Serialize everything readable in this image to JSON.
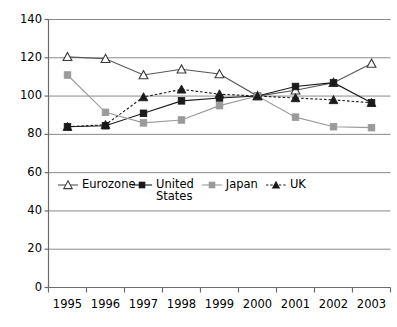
{
  "chart_data": {
    "type": "line",
    "title": "",
    "xlabel": "",
    "ylabel": "",
    "categories": [
      "1995",
      "1996",
      "1997",
      "1998",
      "1999",
      "2000",
      "2001",
      "2002",
      "2003"
    ],
    "x": [
      1995,
      1996,
      1997,
      1998,
      1999,
      2000,
      2001,
      2002,
      2003
    ],
    "ylim": [
      0,
      140
    ],
    "yticks": [
      0,
      20,
      40,
      60,
      80,
      100,
      120,
      140
    ],
    "ytick_labels": [
      "0",
      "20",
      "40",
      "60",
      "80",
      "100",
      "120",
      "140"
    ],
    "grid": "horizontal",
    "legend_position": "inside-lower-left",
    "series": [
      {
        "name": "Eurozone",
        "marker": "open-triangle",
        "line": "solid",
        "color": "#555555",
        "values": [
          120.5,
          119.5,
          111.0,
          114.0,
          111.5,
          100.0,
          103.0,
          107.0,
          117.0
        ]
      },
      {
        "name": "United States",
        "marker": "filled-square",
        "line": "solid",
        "color": "#1a1a1a",
        "values": [
          84.0,
          84.5,
          91.0,
          97.5,
          99.0,
          100.0,
          105.0,
          107.0,
          96.5
        ]
      },
      {
        "name": "Japan",
        "marker": "filled-square",
        "line": "solid",
        "color": "#9a9a9a",
        "values": [
          111.0,
          91.5,
          86.0,
          87.5,
          95.0,
          100.0,
          89.0,
          84.0,
          83.5
        ]
      },
      {
        "name": "UK",
        "marker": "filled-triangle",
        "line": "dotted",
        "color": "#1a1a1a",
        "values": [
          84.0,
          85.0,
          99.5,
          103.5,
          101.0,
          100.0,
          99.0,
          98.0,
          96.5
        ]
      }
    ]
  },
  "legend": {
    "items": [
      {
        "label": "Eurozone"
      },
      {
        "label": "United States"
      },
      {
        "label": "Japan"
      },
      {
        "label": "UK"
      }
    ]
  },
  "colors": {
    "axis": "#6b6b6b",
    "grid": "#8a8a8a",
    "background": "#ffffff",
    "eurozone": "#555555",
    "united_states": "#1a1a1a",
    "japan": "#9a9a9a",
    "uk": "#1a1a1a"
  }
}
